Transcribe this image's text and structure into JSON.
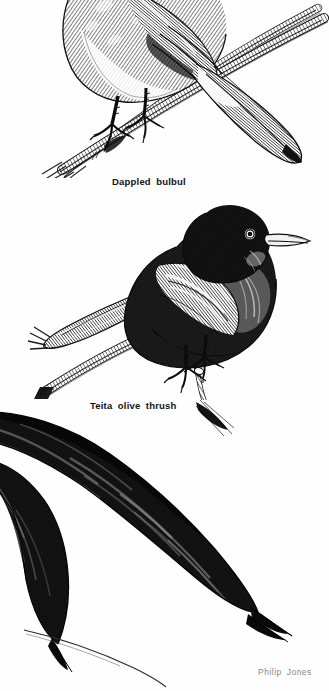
{
  "page": {
    "background_color": "#fefefe",
    "width": 329,
    "height": 691,
    "medium": "pen-and-ink engraving plate"
  },
  "captions": {
    "bulbul": "Dappled bulbul",
    "thrush": "Teita olive thrush"
  },
  "credit": {
    "artist": "Philip Jones"
  },
  "colors": {
    "ink": "#1a1a1a",
    "caption_text": "#121212",
    "credit_text": "#8a8a8a",
    "paper": "#fefefe",
    "mid_tone": "#5a5a5a",
    "light_tone": "#b4b4b4"
  },
  "illustrations": [
    {
      "id": "dappled-bulbul",
      "subject": "Dappled bulbul",
      "pose": "perched on branch, cropped at top edge, tail crossing twig",
      "facing": "left",
      "tone": "mottled grey, pale breast"
    },
    {
      "id": "teita-olive-thrush",
      "subject": "Teita olive thrush",
      "pose": "perched on crossed branch, head raised",
      "facing": "right",
      "tone": "dark, near black with pale wing streaks"
    },
    {
      "id": "long-tailed-bird",
      "subject": "long-tailed bird, cropped at left edge",
      "pose": "body off-frame left, two long tail streamers sweeping to lower right",
      "facing": "left",
      "tone": "dense black cross-hatching"
    }
  ]
}
